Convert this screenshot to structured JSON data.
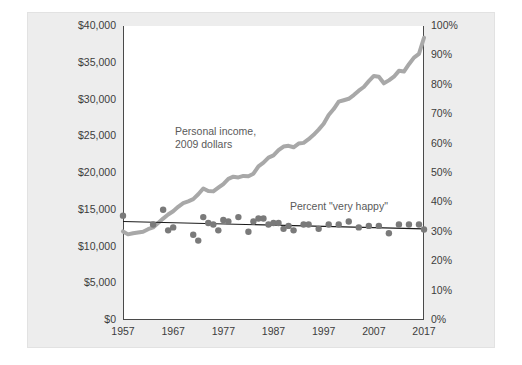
{
  "chart_data": {
    "type": "line",
    "title": "",
    "subtitle": "",
    "xlabel": "",
    "ylabel": "",
    "grid": false,
    "legend_position": "inline-annotations",
    "xlim": [
      1957,
      2017
    ],
    "x_ticks": [
      "1957",
      "1967",
      "1977",
      "1987",
      "1997",
      "2007",
      "2017"
    ],
    "x_tick_values": [
      1957,
      1967,
      1977,
      1987,
      1997,
      2007,
      2017
    ],
    "left_axis": {
      "label": "",
      "ylim": [
        0,
        40000
      ],
      "ticks": [
        "$0",
        "$5,000",
        "$10,000",
        "$15,000",
        "$20,000",
        "$25,000",
        "$30,000",
        "$35,000",
        "$40,000"
      ],
      "tick_values": [
        0,
        5000,
        10000,
        15000,
        20000,
        25000,
        30000,
        35000,
        40000
      ]
    },
    "right_axis": {
      "label": "",
      "ylim": [
        0,
        100
      ],
      "ticks": [
        "0%",
        "10%",
        "20%",
        "30%",
        "40%",
        "50%",
        "60%",
        "70%",
        "80%",
        "90%",
        "100%"
      ],
      "tick_values": [
        0,
        10,
        20,
        30,
        40,
        50,
        60,
        70,
        80,
        90,
        100
      ]
    },
    "annotations": [
      {
        "name": "income-annotation",
        "text": "Personal income,\n2009 dollars",
        "line1": "Personal income,",
        "line2": "2009 dollars",
        "x_px": 175,
        "y_px": 131
      },
      {
        "name": "happiness-annotation",
        "text": "Percent \"very happy\"",
        "x_px": 290,
        "y_px": 205
      }
    ],
    "series": [
      {
        "name": "Personal income, 2009 dollars",
        "type": "line",
        "axis": "left",
        "color": "#a8a8a8",
        "line_width": 4,
        "x": [
          1957,
          1958,
          1959,
          1960,
          1961,
          1962,
          1963,
          1964,
          1965,
          1966,
          1967,
          1968,
          1969,
          1970,
          1971,
          1972,
          1973,
          1974,
          1975,
          1976,
          1977,
          1978,
          1979,
          1980,
          1981,
          1982,
          1983,
          1984,
          1985,
          1986,
          1987,
          1988,
          1989,
          1990,
          1991,
          1992,
          1993,
          1994,
          1995,
          1996,
          1997,
          1998,
          1999,
          2000,
          2001,
          2002,
          2003,
          2004,
          2005,
          2006,
          2007,
          2008,
          2009,
          2010,
          2011,
          2012,
          2013,
          2014,
          2015,
          2016,
          2017
        ],
        "values": [
          12050,
          11650,
          11800,
          11900,
          12000,
          12350,
          12600,
          13200,
          13800,
          14350,
          14800,
          15400,
          15900,
          16150,
          16450,
          17100,
          17900,
          17550,
          17500,
          18000,
          18500,
          19200,
          19500,
          19400,
          19600,
          19550,
          19900,
          20900,
          21400,
          22100,
          22400,
          23100,
          23600,
          23700,
          23500,
          24000,
          24100,
          24600,
          25200,
          25900,
          26700,
          27900,
          28700,
          29700,
          29900,
          30100,
          30600,
          31200,
          31700,
          32500,
          33200,
          33100,
          32200,
          32600,
          33100,
          33900,
          33800,
          34800,
          35700,
          36200,
          38400
        ]
      },
      {
        "name": "Percent \"very happy\"",
        "type": "scatter",
        "axis": "right",
        "color": "#7a7a7a",
        "marker_size": 4,
        "x": [
          1957,
          1963,
          1965,
          1966,
          1967,
          1971,
          1972,
          1973,
          1974,
          1975,
          1976,
          1977,
          1978,
          1980,
          1982,
          1983,
          1984,
          1985,
          1986,
          1987,
          1988,
          1989,
          1990,
          1991,
          1993,
          1994,
          1996,
          1998,
          2000,
          2002,
          2004,
          2006,
          2008,
          2010,
          2012,
          2014,
          2016,
          2017
        ],
        "values": [
          35.5,
          32.5,
          37.5,
          30.5,
          31.5,
          29.0,
          27.0,
          35.0,
          33.0,
          32.5,
          30.5,
          34.0,
          33.5,
          35.0,
          30.0,
          33.5,
          34.5,
          34.5,
          32.5,
          33.0,
          33.0,
          31.0,
          32.0,
          30.5,
          32.5,
          32.5,
          31.0,
          32.5,
          32.5,
          33.5,
          31.5,
          32.0,
          32.0,
          29.5,
          32.5,
          32.5,
          32.5,
          30.8
        ]
      },
      {
        "name": "Happiness trend line",
        "type": "line",
        "axis": "right",
        "color": "#1a1a1a",
        "line_width": 1.2,
        "x": [
          1957,
          2017
        ],
        "values": [
          33.5,
          31.0
        ]
      }
    ]
  },
  "axes_text": {
    "left_ticks": [
      "$40,000",
      "$35,000",
      "$30,000",
      "$25,000",
      "$20,000",
      "$15,000",
      "$10,000",
      "$5,000",
      "$0"
    ],
    "right_ticks": [
      "100%",
      "90%",
      "80%",
      "70%",
      "60%",
      "50%",
      "40%",
      "30%",
      "20%",
      "10%",
      "0%"
    ],
    "x_ticks": [
      "1957",
      "1967",
      "1977",
      "1987",
      "1997",
      "2007",
      "2017"
    ]
  },
  "colors": {
    "panel_background": "#ededed",
    "plot_background": "#ffffff",
    "income_line": "#a8a8a8",
    "scatter_dot": "#7a7a7a",
    "trend_line": "#1a1a1a",
    "axis_text": "#3c3c3c",
    "annotation_text": "#5a5a5a",
    "axis_line": "#4a4a4a"
  }
}
